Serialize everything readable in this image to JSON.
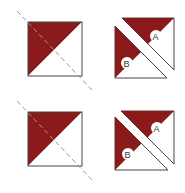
{
  "diagram": {
    "colors": {
      "fabric": "#8b1a1a",
      "outline": "#444444",
      "cut_line": "#888888",
      "background": "#ffffff"
    },
    "rows": [
      {
        "step1": "square with diagonal sewn, dashed cut line",
        "step2": {
          "label_a": "A",
          "label_b": "B"
        }
      },
      {
        "step1": "square with diagonal sewn, dashed cut line",
        "step2": {
          "label_a": "A",
          "label_b": "B"
        }
      }
    ]
  }
}
